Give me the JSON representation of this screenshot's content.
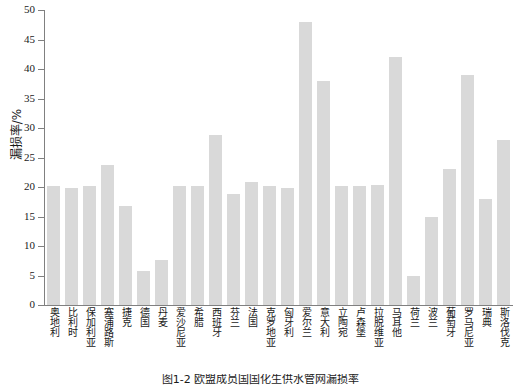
{
  "chart_data": {
    "type": "bar",
    "title": "",
    "xlabel": "",
    "ylabel": "漏损率/%",
    "ylim": [
      0,
      50
    ],
    "ytick_step": 5,
    "yticks": [
      0,
      5,
      10,
      15,
      20,
      25,
      30,
      35,
      40,
      45,
      50
    ],
    "ytick_labels": [
      "0",
      "5",
      "10",
      "15",
      "20",
      "25",
      "30",
      "35",
      "40",
      "45",
      "50"
    ],
    "grid": false,
    "legend": false,
    "legend_position": "none",
    "bar_color": "#d9d9d9",
    "axis_color": "#808080",
    "categories": [
      "奥地利",
      "比利时",
      "保加利亚",
      "塞浦路斯",
      "捷克",
      "德国",
      "丹麦",
      "爱沙尼亚",
      "希腊",
      "西班牙",
      "芬兰",
      "法国",
      "克罗地亚",
      "匈牙利",
      "爱尔兰",
      "意大利",
      "立陶宛",
      "卢森堡",
      "拉脱维亚",
      "马耳他",
      "荷兰",
      "波兰",
      "葡萄牙",
      "罗马尼亚",
      "瑞典",
      "斯洛伐克"
    ],
    "values": [
      20.1,
      19.9,
      20.1,
      23.8,
      16.8,
      5.8,
      7.7,
      20.1,
      20.1,
      28.9,
      18.9,
      20.8,
      20.1,
      19.9,
      48.0,
      38.0,
      20.2,
      20.2,
      20.3,
      42.0,
      5.0,
      15.0,
      23.0,
      39.0,
      18.0,
      27.9
    ]
  },
  "caption": {
    "text": "图1-2 欧盟成员国国化生供水管网漏损率"
  }
}
